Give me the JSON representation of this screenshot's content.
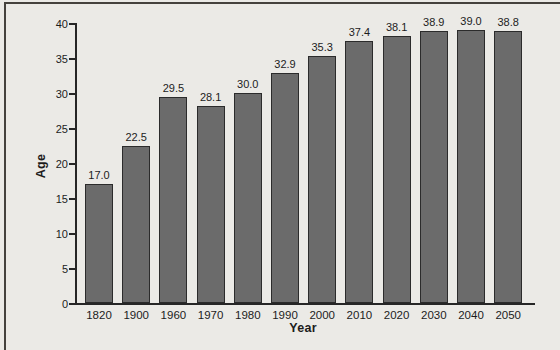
{
  "figure": {
    "background_color": "#ebeae6",
    "frame_color": "#45423d"
  },
  "chart_data": {
    "type": "bar",
    "title": "",
    "xlabel": "Year",
    "ylabel": "Age",
    "categories": [
      "1820",
      "1900",
      "1960",
      "1970",
      "1980",
      "1990",
      "2000",
      "2010",
      "2020",
      "2030",
      "2040",
      "2050"
    ],
    "values": [
      17.0,
      22.5,
      29.5,
      28.1,
      30.0,
      32.9,
      35.3,
      37.4,
      38.1,
      38.9,
      39.0,
      38.8
    ],
    "value_labels": [
      "17.0",
      "22.5",
      "29.5",
      "28.1",
      "30.0",
      "32.9",
      "35.3",
      "37.4",
      "38.1",
      "38.9",
      "39.0",
      "38.8"
    ],
    "ylim": [
      0,
      40
    ],
    "yticks": [
      0,
      5,
      10,
      15,
      20,
      25,
      30,
      35,
      40
    ],
    "grid": false,
    "legend": null,
    "bar_color": "#6b6b6b",
    "bar_border_color": "#2b2b2b",
    "axis_color": "#262626",
    "text_color": "#1c1c1c"
  }
}
